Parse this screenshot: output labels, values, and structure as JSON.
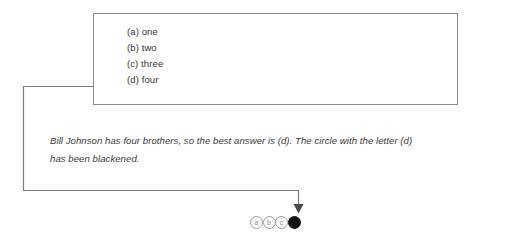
{
  "figure": {
    "choice_box": {
      "name": "answer-choices",
      "items": [
        {
          "label": "(a) one"
        },
        {
          "label": "(b) two"
        },
        {
          "label": "(c) three"
        },
        {
          "label": "(d) four"
        }
      ]
    },
    "explanation": {
      "line1": "Bill Johnson has four brothers, so the best answer is (d). The circle with the letter (d)",
      "line2": "has been blackened."
    },
    "answer_bubbles": {
      "name": "answer-bubble-row",
      "bubbles": [
        {
          "letter": "a",
          "filled": false
        },
        {
          "letter": "b",
          "filled": false
        },
        {
          "letter": "c",
          "filled": false
        },
        {
          "letter": "d",
          "filled": true
        }
      ]
    },
    "colors": {
      "box_border": "#8a8a8a",
      "leader_line": "#7a7a7a",
      "arrow": "#4a4a4a",
      "text": "#353535",
      "bubble_outline": "#9b9b9b",
      "bubble_filled": "#111111",
      "background": "#ffffff"
    }
  }
}
